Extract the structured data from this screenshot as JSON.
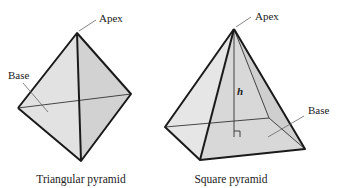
{
  "figures": [
    {
      "name": "triangular-pyramid",
      "caption": "Triangular pyramid",
      "labels": {
        "apex": "Apex",
        "base": "Base"
      }
    },
    {
      "name": "square-pyramid",
      "caption": "Square pyramid",
      "labels": {
        "apex": "Apex",
        "base": "Base",
        "height": "h"
      }
    }
  ],
  "colors": {
    "face_light": "#e4e4e4",
    "face_mid": "#d6d6d6",
    "face_dark": "#cacaca",
    "edge": "#1a1a1a"
  }
}
